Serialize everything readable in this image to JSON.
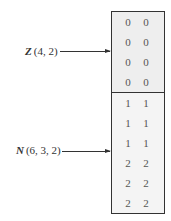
{
  "arrays": [
    {
      "name": "Z",
      "dims": "(4, 2)",
      "rows": [
        [
          "0",
          "0"
        ],
        [
          "0",
          "0"
        ],
        [
          "0",
          "0"
        ],
        [
          "0",
          "0"
        ]
      ]
    },
    {
      "name": "N",
      "dims": "(6, 3, 2)",
      "rows": [
        [
          "1",
          "1"
        ],
        [
          "1",
          "1"
        ],
        [
          "1",
          "1"
        ],
        [
          "2",
          "2"
        ],
        [
          "2",
          "2"
        ],
        [
          "2",
          "2"
        ]
      ]
    }
  ],
  "colors": {
    "border": "#333333",
    "z_fill": "#eeeeee",
    "n_fill": "#f4f4f4"
  }
}
